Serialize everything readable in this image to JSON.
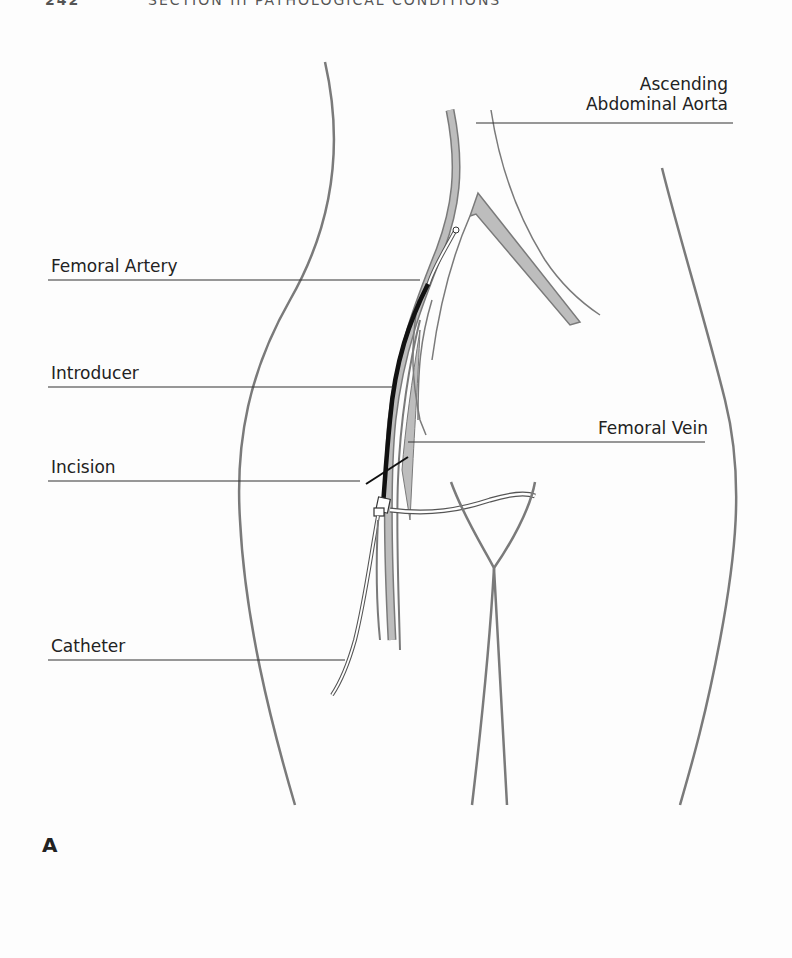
{
  "header": {
    "page_number": "242",
    "section_title": "SECTION III   PATHOLOGICAL CONDITIONS"
  },
  "figure": {
    "panel_label": "A",
    "labels": {
      "ascending_line1": "Ascending",
      "ascending_line2": "Abdominal Aorta",
      "femoral_artery": "Femoral Artery",
      "introducer": "Introducer",
      "femoral_vein": "Femoral Vein",
      "incision": "Incision",
      "catheter": "Catheter"
    },
    "colors": {
      "outline": "#7a7a7a",
      "vessel_fill": "#bdbdbd",
      "introducer": "#111111",
      "leader": "#333333",
      "text": "#222222"
    }
  }
}
